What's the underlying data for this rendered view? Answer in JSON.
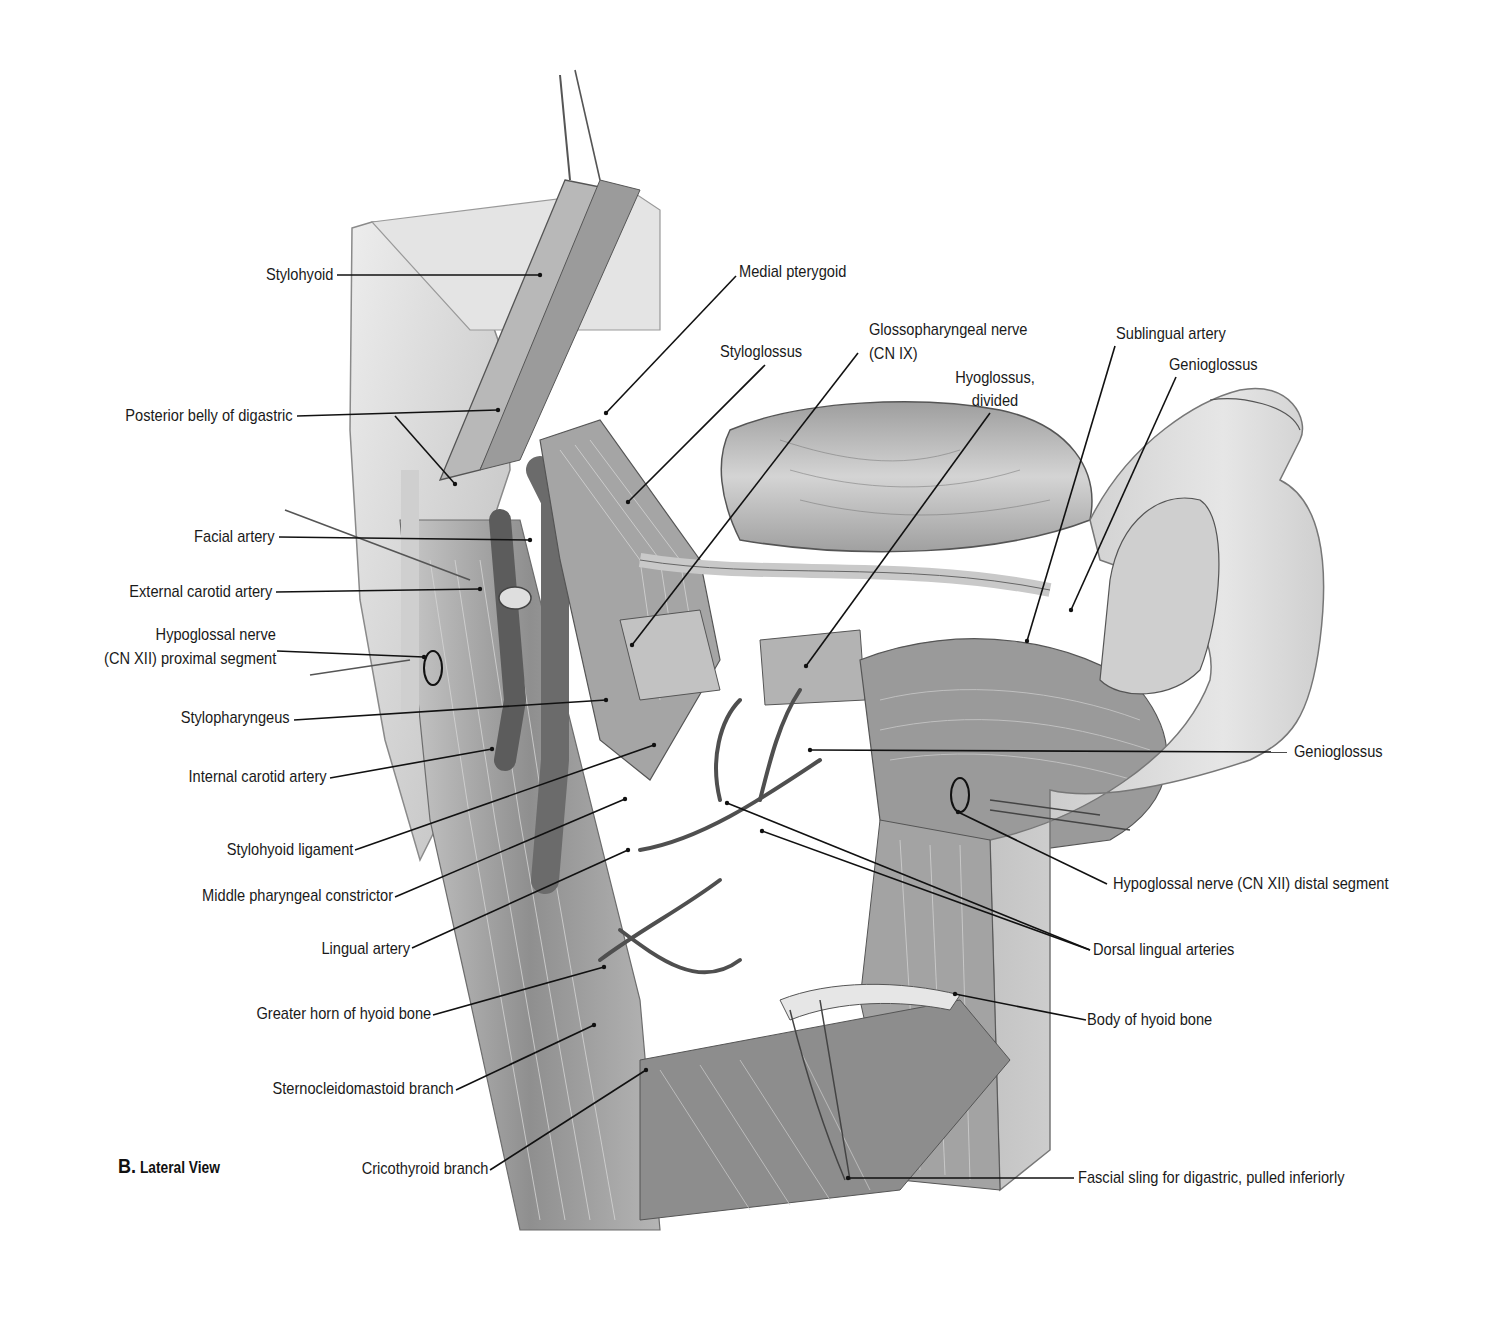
{
  "figure": {
    "panel_letter": "B.",
    "panel_title": "Lateral View"
  },
  "labels": {
    "stylohyoid": "Stylohyoid",
    "posterior_belly_digastric": "Posterior belly of digastric",
    "facial_artery": "Facial artery",
    "external_carotid_artery": "External carotid artery",
    "hypoglossal_proximal_line1": "Hypoglossal nerve",
    "hypoglossal_proximal_line2": "(CN XII) proximal segment",
    "stylopharyngeus": "Stylopharyngeus",
    "internal_carotid_artery": "Internal carotid artery",
    "stylohyoid_ligament": "Stylohyoid ligament",
    "middle_pharyngeal_constrictor": "Middle pharyngeal constrictor",
    "lingual_artery": "Lingual artery",
    "greater_horn_hyoid": "Greater horn of hyoid bone",
    "sternocleidomastoid_branch": "Sternocleidomastoid branch",
    "cricothyroid_branch": "Cricothyroid branch",
    "medial_pterygoid": "Medial pterygoid",
    "styloglossus": "Styloglossus",
    "glossopharyngeal_line1": "Glossopharyngeal nerve",
    "glossopharyngeal_line2": "(CN IX)",
    "hyoglossus_line1": "Hyoglossus,",
    "hyoglossus_line2": "divided",
    "sublingual_artery": "Sublingual artery",
    "genioglossus_top": "Genioglossus",
    "genioglossus_right": "Genioglossus",
    "hypoglossal_distal": "Hypoglossal nerve (CN XII) distal segment",
    "dorsal_lingual_arteries": "Dorsal lingual arteries",
    "body_hyoid": "Body of hyoid bone",
    "fascial_sling": "Fascial sling for digastric, pulled inferiorly"
  },
  "colors": {
    "background": "#ffffff",
    "text": "#1a1a1a",
    "leader": "#111111",
    "tissue_light": "#d9d9d9",
    "tissue_mid": "#a8a8a8",
    "tissue_dark": "#5a5a5a"
  }
}
